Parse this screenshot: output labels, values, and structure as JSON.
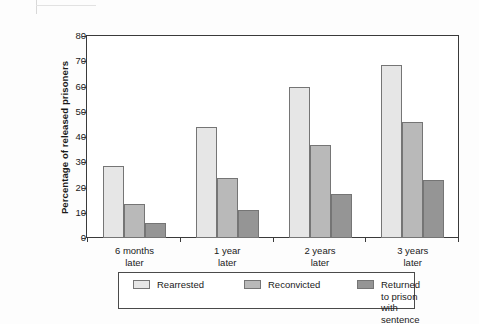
{
  "chart_data": {
    "type": "bar",
    "title": "",
    "subtitle": "",
    "xlabel": "",
    "ylabel": "Percentage of released prisoners",
    "ylim": [
      0,
      80
    ],
    "yticks": [
      0,
      10,
      20,
      30,
      40,
      50,
      60,
      70,
      80
    ],
    "grid": false,
    "legend_position": "bottom",
    "categories": [
      "6 months\nlater",
      "1 year\nlater",
      "2 years\nlater",
      "3 years\nlater"
    ],
    "category_lines": [
      {
        "line1": "6 months",
        "line2": "later"
      },
      {
        "line1": "1 year",
        "line2": "later"
      },
      {
        "line1": "2 years",
        "line2": "later"
      },
      {
        "line1": "3 years",
        "line2": "later"
      }
    ],
    "series": [
      {
        "name": "Rearrested",
        "color": "#e6e6e6",
        "values": [
          28.7,
          44.0,
          60.0,
          68.5
        ]
      },
      {
        "name": "Reconvicted",
        "color": "#b9b9b9",
        "values": [
          13.3,
          23.6,
          37.0,
          45.8
        ]
      },
      {
        "name": "Returned to prison with sentence",
        "color": "#959595",
        "values": [
          5.9,
          11.0,
          17.6,
          22.8
        ]
      }
    ]
  },
  "legend": {
    "entries": [
      {
        "label": "Rearrested",
        "color": "#e6e6e6"
      },
      {
        "label": "Reconvicted",
        "color": "#b9b9b9"
      },
      {
        "label": "Returned to prison\nwith sentence",
        "color": "#959595"
      }
    ]
  },
  "axis": {
    "y_title": "Percentage of released prisoners",
    "y_tick_labels": [
      "80",
      "70",
      "60",
      "50",
      "40",
      "30",
      "20",
      "10",
      "0"
    ]
  }
}
